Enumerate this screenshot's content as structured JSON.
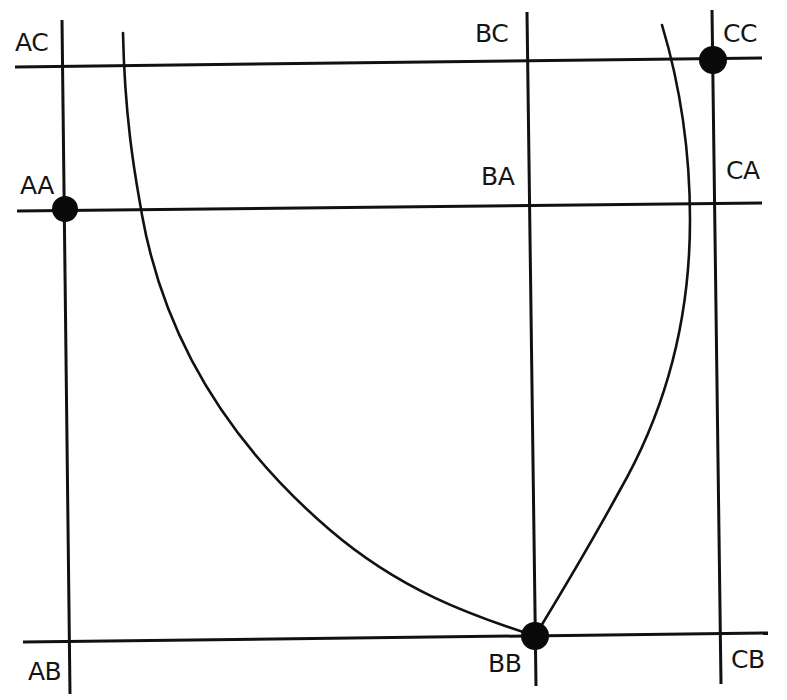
{
  "diagram": {
    "title": "",
    "labels": {
      "AC": "AC",
      "AA": "AA",
      "AB": "AB",
      "BC": "BC",
      "BA": "BA",
      "BB": "BB",
      "CC": "CC",
      "CA": "CA",
      "CB": "CB"
    },
    "grid": {
      "columns": [
        "A",
        "B",
        "C"
      ],
      "rows": [
        "C",
        "A",
        "B"
      ]
    },
    "highlighted_nodes": [
      "AA",
      "CC",
      "BB"
    ],
    "curves": [
      {
        "name": "left-curve",
        "from": "top",
        "to": "BB"
      },
      {
        "name": "right-curve",
        "from": "top",
        "to": "BB"
      }
    ],
    "colors": {
      "line": "#111111",
      "node": "#0a0a0a",
      "background": "#ffffff"
    }
  }
}
